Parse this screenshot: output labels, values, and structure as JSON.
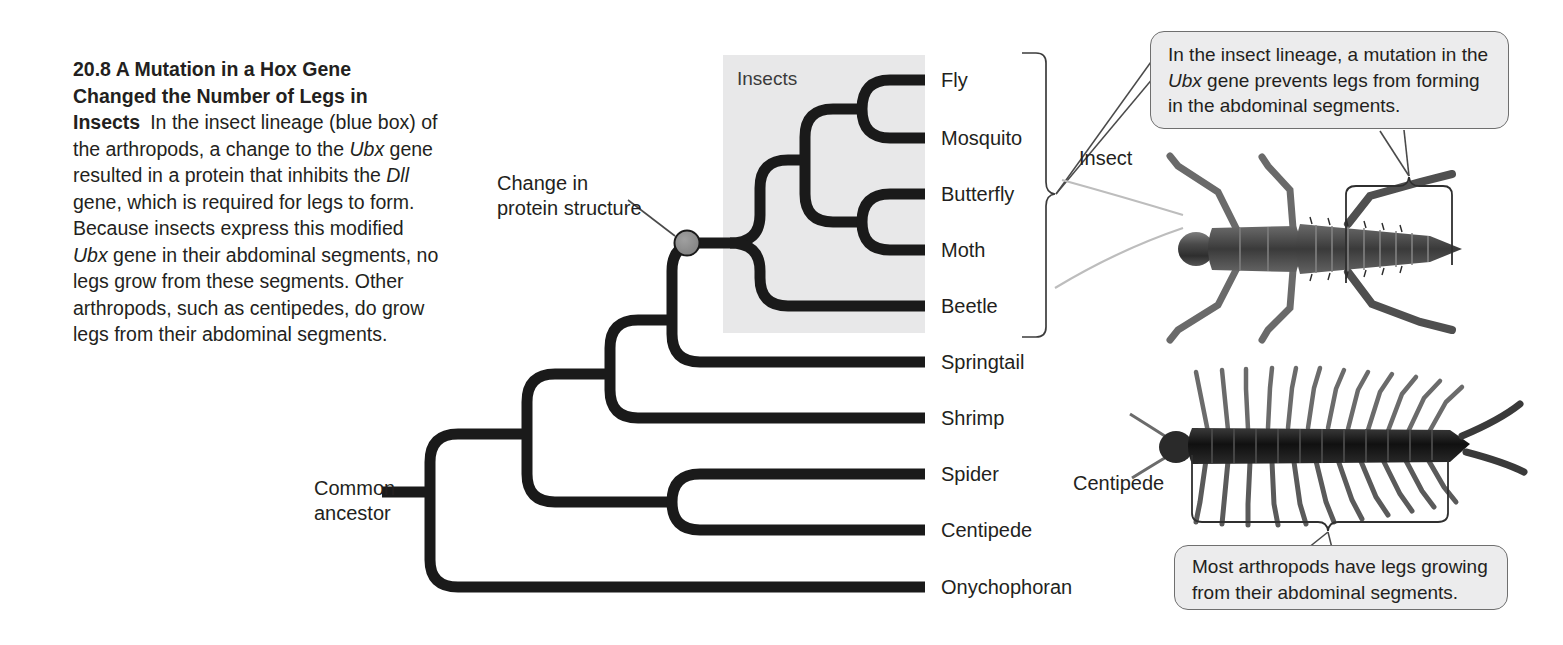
{
  "figure": {
    "number": "20.8",
    "title": "A Mutation in a Hox Gene Changed the Number of Legs in Insects",
    "title_line1": "20.8  A Mutation in a Hox Gene",
    "title_line2": "Changed the Number of Legs in",
    "title_line3": "Insects",
    "caption_part1": "In the insect lineage (blue box) of the arthropods, a change to the ",
    "caption_gene1": "Ubx",
    "caption_part2": " gene resulted in a protein that inhibits the ",
    "caption_gene2": "Dll",
    "caption_part3": " gene, which is required for legs to form. Because insects express this modified ",
    "caption_gene3": "Ubx",
    "caption_part4": " gene in their abdominal segments, no legs grow from these segments. Other arthropods, such as centipedes, do grow legs from their abdominal segments."
  },
  "tree": {
    "clade_box_label": "Insects",
    "root_label_line1": "Common",
    "root_label_line2": "ancestor",
    "event_label_line1": "Change in",
    "event_label_line2": "protein structure",
    "tips": [
      {
        "label": "Fly",
        "y": 80,
        "in_insect_clade": true
      },
      {
        "label": "Mosquito",
        "y": 138,
        "in_insect_clade": true
      },
      {
        "label": "Butterfly",
        "y": 194,
        "in_insect_clade": true
      },
      {
        "label": "Moth",
        "y": 250,
        "in_insect_clade": true
      },
      {
        "label": "Beetle",
        "y": 306,
        "in_insect_clade": true
      },
      {
        "label": "Springtail",
        "y": 362,
        "in_insect_clade": false
      },
      {
        "label": "Shrimp",
        "y": 418,
        "in_insect_clade": false
      },
      {
        "label": "Spider",
        "y": 474,
        "in_insect_clade": false
      },
      {
        "label": "Centipede",
        "y": 530,
        "in_insect_clade": false
      },
      {
        "label": "Onychophoran",
        "y": 587,
        "in_insect_clade": false
      }
    ],
    "colors": {
      "branch": "#1a1a1a",
      "clade_box_fill": "#e8e8e9",
      "node_marker_fill": "#8c8c8c",
      "node_marker_stroke": "#1a1a1a",
      "text": "#231f20",
      "callout_fill": "#ececed",
      "callout_stroke": "#6f6f6f"
    }
  },
  "photos": [
    {
      "name": "insect",
      "label": "Insect"
    },
    {
      "name": "centipede",
      "label": "Centipede"
    }
  ],
  "callouts": {
    "top": {
      "line1_part1": "In the insect lineage, a mutation in the ",
      "gene": "Ubx",
      "line1_part2": " gene prevents legs from forming in the abdominal segments."
    },
    "bottom": {
      "text": "Most arthropods have legs growing from their abdominal segments."
    }
  }
}
